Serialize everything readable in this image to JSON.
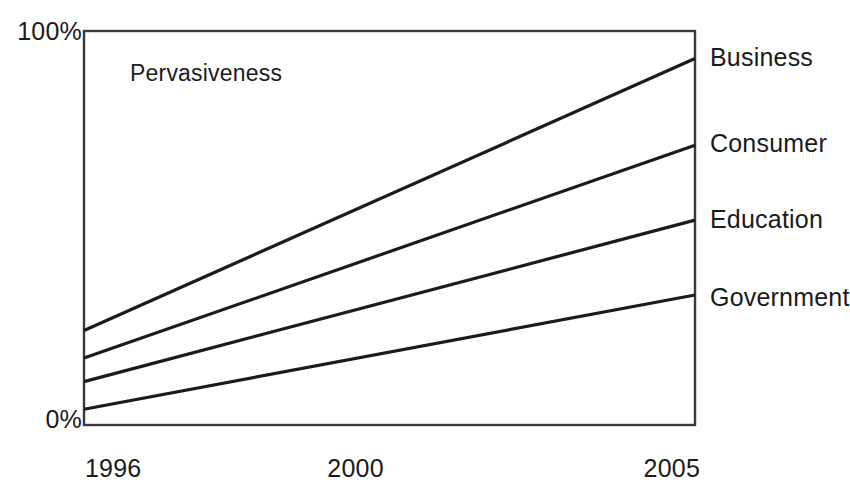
{
  "chart_data": {
    "type": "line",
    "title": "",
    "subtitle": "",
    "xlabel": "",
    "ylabel": "",
    "annotation": "Pervasiveness",
    "x": [
      1996,
      2005
    ],
    "x_tick_labels": [
      "1996",
      "2000",
      "2005"
    ],
    "x_tick_values": [
      1996,
      2000,
      2005
    ],
    "xlim": [
      1996,
      2005
    ],
    "y_tick_labels": [
      "100%",
      "0%"
    ],
    "y_tick_values": [
      100,
      0
    ],
    "ylim": [
      0,
      100
    ],
    "y_unit": "%",
    "grid": false,
    "legend_position": "right-of-line-ends",
    "line_color": "#1b1b1b",
    "frame_color": "#3a3a3a",
    "series": [
      {
        "name": "Business",
        "values": [
          24,
          93
        ]
      },
      {
        "name": "Consumer",
        "values": [
          17,
          71
        ]
      },
      {
        "name": "Education",
        "values": [
          11,
          52
        ]
      },
      {
        "name": "Government",
        "values": [
          4,
          33
        ]
      }
    ]
  }
}
